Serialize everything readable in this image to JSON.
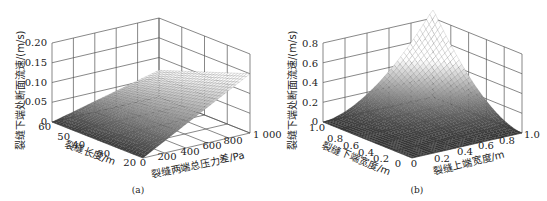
{
  "figures": [
    {
      "id": "a",
      "caption": "(a)",
      "z_label": "裂缝下端处断面流速/(m/s)",
      "x_label": "裂缝两端总压力差/Pa",
      "y_label": "裂缝长度/m",
      "z_ticks": [
        "0",
        "0.05",
        "0.10",
        "0.15",
        "0.20"
      ],
      "x_ticks": [
        "0",
        "200",
        "400",
        "600",
        "800",
        "1 000"
      ],
      "y_ticks": [
        "20",
        "30",
        "40",
        "50",
        "60"
      ]
    },
    {
      "id": "b",
      "caption": "(b)",
      "z_label": "裂缝下端处断面流速/(m/s)",
      "x_label": "裂缝上端宽度/m",
      "y_label": "裂缝下端宽度/m",
      "z_ticks": [
        "0",
        "0.2",
        "0.4",
        "0.6",
        "0.8"
      ],
      "x_ticks": [
        "0",
        "0.2",
        "0.4",
        "0.6",
        "0.8",
        "1.0"
      ],
      "y_ticks": [
        "0",
        "0.2",
        "0.4",
        "0.6",
        "0.8",
        "1.0"
      ]
    }
  ],
  "chart_data": [
    {
      "type": "surface",
      "title": "(a)",
      "xlabel": "裂缝两端总压力差/Pa",
      "ylabel": "裂缝长度/m",
      "zlabel": "裂缝下端处断面流速/(m/s)",
      "xlim": [
        0,
        1000
      ],
      "ylim": [
        20,
        60
      ],
      "zlim": [
        0,
        0.2
      ],
      "x_ticks": [
        0,
        200,
        400,
        600,
        800,
        1000
      ],
      "y_ticks": [
        20,
        30,
        40,
        50,
        60
      ],
      "z_ticks": [
        0,
        0.05,
        0.1,
        0.15,
        0.2
      ],
      "grid": true,
      "colormap": "gray",
      "description": "Velocity rises roughly linearly with pressure difference and decreases with fissure length; max ≈0.15 m/s at 1000 Pa, 20 m; ≈0 at 0 Pa",
      "samples": [
        {
          "x": 0,
          "y": 20,
          "z": 0.0
        },
        {
          "x": 1000,
          "y": 20,
          "z": 0.15
        },
        {
          "x": 1000,
          "y": 60,
          "z": 0.07
        },
        {
          "x": 0,
          "y": 60,
          "z": 0.0
        },
        {
          "x": 500,
          "y": 20,
          "z": 0.075
        },
        {
          "x": 500,
          "y": 60,
          "z": 0.035
        }
      ]
    },
    {
      "type": "surface",
      "title": "(b)",
      "xlabel": "裂缝上端宽度/m",
      "ylabel": "裂缝下端宽度/m",
      "zlabel": "裂缝下端处断面流速/(m/s)",
      "xlim": [
        0,
        1.0
      ],
      "ylim": [
        0,
        1.0
      ],
      "zlim": [
        0,
        0.8
      ],
      "x_ticks": [
        0,
        0.2,
        0.4,
        0.6,
        0.8,
        1.0
      ],
      "y_ticks": [
        0,
        0.2,
        0.4,
        0.6,
        0.8,
        1.0
      ],
      "z_ticks": [
        0,
        0.2,
        0.4,
        0.6,
        0.8
      ],
      "grid": true,
      "colormap": "gray",
      "description": "Velocity increases sharply as both upper and lower widths approach 1.0 m; peak ≈0.85 m/s at (1.0, 1.0); near 0 when either width is small",
      "samples": [
        {
          "x": 0,
          "y": 0,
          "z": 0.0
        },
        {
          "x": 1.0,
          "y": 0,
          "z": 0.0
        },
        {
          "x": 0,
          "y": 1.0,
          "z": 0.0
        },
        {
          "x": 0.5,
          "y": 0.5,
          "z": 0.2
        },
        {
          "x": 1.0,
          "y": 1.0,
          "z": 0.85
        }
      ]
    }
  ]
}
